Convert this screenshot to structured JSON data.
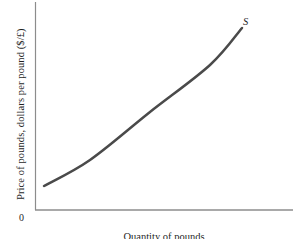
{
  "chart_data": {
    "type": "line",
    "title": "",
    "subtitle": "",
    "ylabel": "Price of pounds, dollars per pound ($/£)",
    "xlabel": "Quantity of pounds",
    "origin_label": "0",
    "grid": false,
    "legend": "none",
    "xlim": [
      0,
      1
    ],
    "ylim": [
      0,
      1
    ],
    "xticks": [],
    "yticks": [],
    "series": [
      {
        "name": "S",
        "label": "S",
        "label_style": "italic",
        "color": "#4a4a4a",
        "linewidth": 2.5,
        "annotation": "Supply curve of pounds, upward sloping and convex",
        "x": [
          0.035,
          0.214,
          0.446,
          0.678,
          0.802
        ],
        "y": [
          0.115,
          0.24,
          0.471,
          0.697,
          0.875
        ],
        "points_px": [
          [
            44,
            186
          ],
          [
            90,
            160
          ],
          [
            150,
            112
          ],
          [
            210,
            65
          ],
          [
            242,
            28
          ]
        ]
      }
    ],
    "axes": {
      "color": "#8c8c8c",
      "linewidth": 1,
      "y_axis_px": {
        "x": 35,
        "y_top": 2,
        "y_bottom": 210
      },
      "x_axis_px": {
        "y": 210,
        "x_left": 35,
        "x_right": 293
      }
    },
    "background_color": "#ffffff"
  }
}
